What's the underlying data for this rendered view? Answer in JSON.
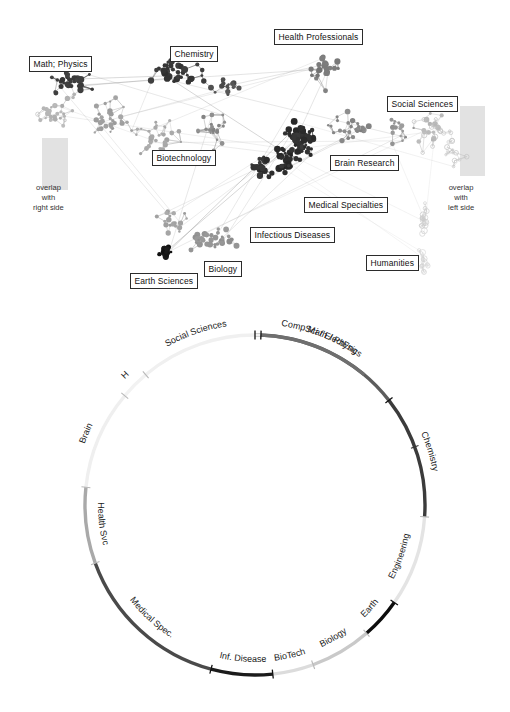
{
  "figure": {
    "panels": [
      "science-map-network",
      "circular-base-map"
    ]
  },
  "map": {
    "labels": [
      {
        "name": "math-physics",
        "text": "Math; Physics",
        "x": 29,
        "y": 56
      },
      {
        "name": "chemistry",
        "text": "Chemistry",
        "x": 170,
        "y": 46
      },
      {
        "name": "health-professionals",
        "text": "Health Professionals",
        "x": 274,
        "y": 29
      },
      {
        "name": "social-sciences",
        "text": "Social Sciences",
        "x": 387,
        "y": 96
      },
      {
        "name": "biotechnology",
        "text": "Biotechnology",
        "x": 152,
        "y": 150
      },
      {
        "name": "brain-research",
        "text": "Brain Research",
        "x": 330,
        "y": 155
      },
      {
        "name": "medical-specialties",
        "text": "Medical Specialties",
        "x": 304,
        "y": 197
      },
      {
        "name": "infectious-diseases",
        "text": "Infectious Diseases",
        "x": 250,
        "y": 227
      },
      {
        "name": "humanities",
        "text": "Humanities",
        "x": 366,
        "y": 255
      },
      {
        "name": "biology",
        "text": "Biology",
        "x": 204,
        "y": 261
      },
      {
        "name": "earth-sciences",
        "text": "Earth Sciences",
        "x": 130,
        "y": 273
      }
    ],
    "overlap_notes": [
      {
        "name": "overlap-left",
        "lines": [
          "overlap",
          "with",
          "right side"
        ],
        "x": 33,
        "y": 183
      },
      {
        "name": "overlap-right",
        "lines": [
          "overlap",
          "with",
          "left side"
        ],
        "x": 448,
        "y": 183
      }
    ],
    "overlap_bands": [
      {
        "name": "overlap-band-left",
        "x": 42,
        "y": 138,
        "w": 26,
        "h": 52,
        "color": "#e2e2e2"
      },
      {
        "name": "overlap-band-right",
        "x": 460,
        "y": 106,
        "w": 25,
        "h": 70,
        "color": "#e2e2e2"
      }
    ]
  },
  "chart_data": {
    "type": "pie",
    "layout": {
      "center_x": 255,
      "center_y": 213,
      "radius": 170,
      "start_angle_deg": -90,
      "direction": "clockwise"
    },
    "axis_note": "Arc lengths are proportional to share of the full circle (degrees).",
    "categories": [
      "Math / Physics",
      "Chemistry",
      "Engineering",
      "Earth",
      "Biology",
      "BioTech",
      "Inf. Disease",
      "Medical Spec.",
      "Health Svc",
      "Brain",
      "H",
      "Social Sciences",
      "CompSci / ElectEng"
    ],
    "values_deg": [
      52,
      42,
      31,
      14,
      21,
      14,
      21,
      55,
      26,
      34,
      10,
      42,
      38
    ],
    "colors": [
      "#5d5d5d",
      "#3b3b3b",
      "#e4e4e4",
      "#0d0d0d",
      "#c9c9c9",
      "#dcdcdc",
      "#1b1b1b",
      "#4a4a4a",
      "#a9a9a9",
      "#efefef",
      "#f2f2f2",
      "#f0f0f0",
      "#6f6f6f"
    ],
    "segments": [
      {
        "label": "Math / Physics",
        "start_deg": -90,
        "end_deg": -38,
        "color": "#5d5d5d",
        "tick_at_start": true
      },
      {
        "label": "Chemistry",
        "start_deg": -38,
        "end_deg": 4,
        "color": "#3b3b3b",
        "tick_at_start": true
      },
      {
        "label": "Engineering",
        "start_deg": 4,
        "end_deg": 35,
        "color": "#e4e4e4",
        "tick_at_start": true
      },
      {
        "label": "Earth",
        "start_deg": 35,
        "end_deg": 49,
        "color": "#0d0d0d",
        "tick_at_start": true
      },
      {
        "label": "Biology",
        "start_deg": 49,
        "end_deg": 70,
        "color": "#c9c9c9",
        "tick_at_start": true
      },
      {
        "label": "BioTech",
        "start_deg": 70,
        "end_deg": 84,
        "color": "#dcdcdc",
        "tick_at_start": true
      },
      {
        "label": "Inf. Disease",
        "start_deg": 84,
        "end_deg": 105,
        "color": "#1b1b1b",
        "tick_at_start": true
      },
      {
        "label": "Medical Spec.",
        "start_deg": 105,
        "end_deg": 160,
        "color": "#4a4a4a",
        "tick_at_start": true
      },
      {
        "label": "Health Svc",
        "start_deg": 160,
        "end_deg": 186,
        "color": "#a9a9a9",
        "tick_at_start": true
      },
      {
        "label": "Brain",
        "start_deg": 186,
        "end_deg": 220,
        "color": "#efefef",
        "tick_at_start": true
      },
      {
        "label": "H",
        "start_deg": 220,
        "end_deg": 230,
        "color": "#f2f2f2",
        "tick_at_start": true
      },
      {
        "label": "Social Sciences",
        "start_deg": 230,
        "end_deg": 272,
        "color": "#f0f0f0",
        "tick_at_start": true
      },
      {
        "label": "CompSci / ElectEng",
        "start_deg": 272,
        "end_deg": 310,
        "color": "#6f6f6f",
        "tick_at_start": true
      }
    ],
    "extra_ticks_deg": [
      -20
    ],
    "grid": false,
    "legend": "none"
  }
}
